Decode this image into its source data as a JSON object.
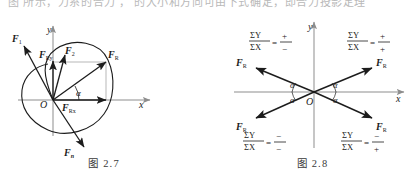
{
  "page": {
    "cut_off_header_text": "图 所示，力系的合力 ， 的大小和方向可由下式确定，即合力投影定理"
  },
  "figure_left": {
    "caption": "图 2.7",
    "axis": {
      "x_label": "x",
      "y_label": "y",
      "origin_label": "O"
    },
    "angle_label": "α",
    "vectors": [
      {
        "name": "F1",
        "label": "F",
        "subscript": "1",
        "angle_deg": 118,
        "length": 62
      },
      {
        "name": "FRy",
        "label": "F",
        "subscript": "Ry",
        "angle_deg": 90,
        "length": 40
      },
      {
        "name": "F2",
        "label": "F",
        "subscript": "2",
        "angle_deg": 76,
        "length": 48
      },
      {
        "name": "FR",
        "label": "F",
        "subscript": "R",
        "angle_deg": 33,
        "length": 63
      },
      {
        "name": "FRx",
        "label": "F",
        "subscript": "Rx",
        "angle_deg": 0,
        "length": 53
      },
      {
        "name": "Fn",
        "label": "F",
        "subscript": "n",
        "angle_deg": -62,
        "length": 66
      }
    ],
    "body_outline": "irregular closed rigid body contour"
  },
  "figure_right": {
    "caption": "图 2.8",
    "axis": {
      "x_label": "x",
      "y_label": "y",
      "origin_label": "O"
    },
    "angle_label": "α",
    "resultant_label": "F",
    "resultant_subscript": "R",
    "quadrants": [
      {
        "name": "quadrant-2",
        "numerator": "ΣY",
        "denominator": "ΣX",
        "sign_numerator": "+",
        "sign_denominator": "−"
      },
      {
        "name": "quadrant-1",
        "numerator": "ΣY",
        "denominator": "ΣX",
        "sign_numerator": "+",
        "sign_denominator": "+"
      },
      {
        "name": "quadrant-3",
        "numerator": "ΣY",
        "denominator": "ΣX",
        "sign_numerator": "−",
        "sign_denominator": "−"
      },
      {
        "name": "quadrant-4",
        "numerator": "ΣY",
        "denominator": "ΣX",
        "sign_numerator": "−",
        "sign_denominator": "+"
      }
    ],
    "angle_count": 4
  },
  "colors": {
    "ink": "#1c1c1c",
    "axis": "#8d8d8d",
    "background": "#ffffff",
    "faint": "#b9b9b9"
  }
}
